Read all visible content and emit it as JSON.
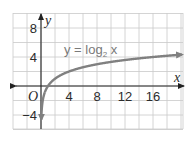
{
  "chart_data": {
    "type": "line",
    "title": "",
    "xlabel": "x",
    "ylabel": "y",
    "origin_label": "O",
    "xlim": [
      -4,
      20.3
    ],
    "ylim": [
      -5.8,
      10
    ],
    "grid": true,
    "grid_step": 2,
    "x_ticks": [
      4,
      8,
      12,
      16
    ],
    "x_tick_labels": [
      "4",
      "8",
      "12",
      "16"
    ],
    "y_ticks": [
      8,
      4,
      -4
    ],
    "y_tick_labels": [
      "8",
      "4",
      "−4"
    ],
    "series": [
      {
        "name": "y = log₂ x",
        "function": "log2(x)",
        "x": [
          0.02,
          0.05,
          0.1,
          0.25,
          0.5,
          1,
          2,
          4,
          8,
          12,
          16,
          20.3
        ],
        "y": [
          -5.6,
          -4.32,
          -3.32,
          -2,
          -1,
          0,
          1,
          2,
          3,
          3.58,
          4,
          4.34
        ]
      }
    ],
    "annotations": [
      {
        "text_main": "y = log",
        "subscript": "2",
        "text_tail": " x",
        "x": 6.5,
        "y": 4.7
      }
    ],
    "colors": {
      "curve": "#808080",
      "grid": "#c9c9c9",
      "axis": "#222222"
    }
  }
}
